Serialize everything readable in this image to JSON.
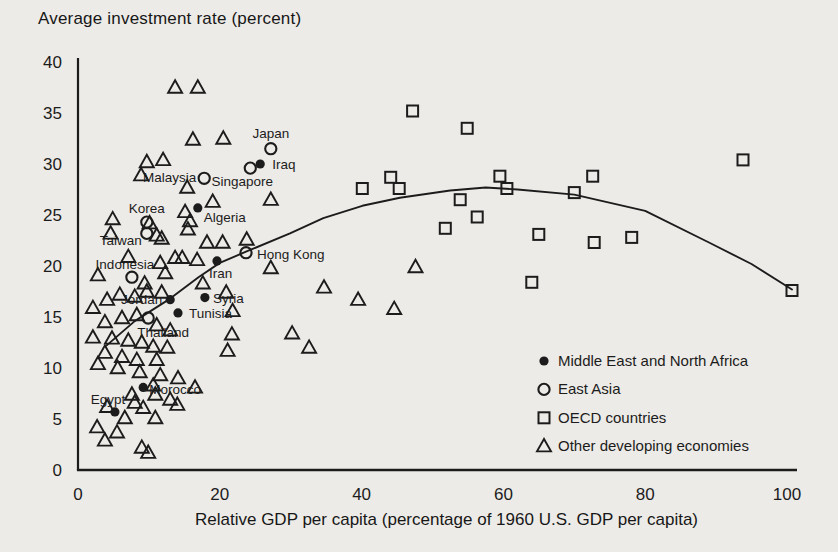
{
  "page": {
    "background": "#edebe7",
    "ink_color": "#1c1c1c"
  },
  "chart_data": {
    "type": "scatter",
    "title": "Average investment rate (percent)",
    "xlabel": "Relative GDP per capita (percentage of 1960 U.S. GDP per capita)",
    "ylabel": "Average investment rate (percent)",
    "xlim": [
      0,
      103
    ],
    "ylim": [
      0,
      40
    ],
    "x_ticks": [
      0,
      20,
      40,
      60,
      80,
      100
    ],
    "y_ticks": [
      0,
      5,
      10,
      15,
      20,
      25,
      30,
      35,
      40
    ],
    "grid": false,
    "legend_position": "inside-bottom-right",
    "series": [
      {
        "name": "Middle East and North Africa",
        "marker": "filled-circle",
        "points": [
          {
            "x": 25.7,
            "y": 30.0,
            "label": "Iraq",
            "dx": 12,
            "dy": 5,
            "anchor": "start"
          },
          {
            "x": 16.9,
            "y": 25.7,
            "label": "Algeria",
            "dx": 6,
            "dy": 14,
            "anchor": "start"
          },
          {
            "x": 19.6,
            "y": 20.5,
            "label": "Iran",
            "dx": -8,
            "dy": 17,
            "anchor": "start"
          },
          {
            "x": 17.9,
            "y": 16.9,
            "label": "Syria",
            "dx": 8,
            "dy": 5,
            "anchor": "start"
          },
          {
            "x": 13.0,
            "y": 16.7,
            "label": "Jordan",
            "dx": -8,
            "dy": 4,
            "anchor": "end"
          },
          {
            "x": 14.1,
            "y": 15.4,
            "label": "Tunisia",
            "dx": 11,
            "dy": 5,
            "anchor": "start"
          },
          {
            "x": 9.2,
            "y": 8.1,
            "label": "Morocco",
            "dx": 6,
            "dy": 7,
            "anchor": "start"
          },
          {
            "x": 5.2,
            "y": 5.7,
            "label": "Egypt",
            "dx": -7,
            "dy": -8,
            "anchor": "middle"
          }
        ]
      },
      {
        "name": "East Asia",
        "marker": "open-circle",
        "points": [
          {
            "x": 27.2,
            "y": 31.5,
            "label": "Japan",
            "dx": 0,
            "dy": -11,
            "anchor": "middle"
          },
          {
            "x": 24.3,
            "y": 29.6,
            "label": "Singapore",
            "dx": -8,
            "dy": 18,
            "anchor": "middle"
          },
          {
            "x": 17.8,
            "y": 28.6,
            "label": "Malaysia",
            "dx": -8,
            "dy": 4,
            "anchor": "end"
          },
          {
            "x": 9.7,
            "y": 24.3,
            "label": "Korea",
            "dx": 0,
            "dy": -9,
            "anchor": "middle"
          },
          {
            "x": 9.7,
            "y": 23.2,
            "label": "Taiwan",
            "dx": -5,
            "dy": 12,
            "anchor": "end"
          },
          {
            "x": 7.6,
            "y": 18.9,
            "label": "Indonesia",
            "dx": -7,
            "dy": -8,
            "anchor": "middle"
          },
          {
            "x": 23.7,
            "y": 21.3,
            "label": "Hong Kong",
            "dx": 11,
            "dy": 6,
            "anchor": "start"
          },
          {
            "x": 9.9,
            "y": 14.9,
            "label": "Thailand",
            "dx": -11,
            "dy": 19,
            "anchor": "start"
          }
        ]
      },
      {
        "name": "OECD countries",
        "marker": "open-square",
        "points": [
          [
            47.2,
            35.2
          ],
          [
            54.9,
            33.5
          ],
          [
            40.1,
            27.6
          ],
          [
            44.1,
            28.7
          ],
          [
            45.3,
            27.6
          ],
          [
            53.9,
            26.5
          ],
          [
            51.8,
            23.7
          ],
          [
            56.3,
            24.8
          ],
          [
            59.5,
            28.8
          ],
          [
            60.5,
            27.6
          ],
          [
            64.0,
            18.4
          ],
          [
            65.0,
            23.1
          ],
          [
            70.0,
            27.2
          ],
          [
            72.6,
            28.8
          ],
          [
            72.8,
            22.3
          ],
          [
            78.1,
            22.8
          ],
          [
            93.8,
            30.4
          ],
          [
            100.7,
            17.6
          ]
        ]
      },
      {
        "name": "Other developing economies",
        "marker": "open-triangle",
        "points": [
          [
            13.7,
            37.5
          ],
          [
            16.9,
            37.5
          ],
          [
            16.2,
            32.4
          ],
          [
            20.5,
            32.5
          ],
          [
            9.7,
            30.2
          ],
          [
            12.0,
            30.4
          ],
          [
            8.9,
            28.9
          ],
          [
            15.4,
            27.7
          ],
          [
            19.0,
            26.3
          ],
          [
            27.2,
            26.5
          ],
          [
            15.1,
            25.3
          ],
          [
            4.9,
            24.6
          ],
          [
            10.1,
            24.2
          ],
          [
            15.8,
            24.4
          ],
          [
            4.6,
            23.2
          ],
          [
            11.1,
            23.0
          ],
          [
            15.5,
            23.6
          ],
          [
            23.8,
            22.6
          ],
          [
            11.8,
            22.7
          ],
          [
            18.2,
            22.3
          ],
          [
            20.4,
            22.3
          ],
          [
            7.1,
            20.9
          ],
          [
            11.6,
            20.3
          ],
          [
            13.7,
            20.8
          ],
          [
            14.7,
            20.8
          ],
          [
            16.8,
            20.6
          ],
          [
            12.3,
            19.3
          ],
          [
            2.8,
            19.1
          ],
          [
            9.4,
            18.3
          ],
          [
            17.6,
            18.3
          ],
          [
            4.1,
            16.7
          ],
          [
            5.9,
            17.2
          ],
          [
            8.0,
            17.0
          ],
          [
            9.7,
            17.5
          ],
          [
            11.8,
            17.4
          ],
          [
            20.9,
            17.4
          ],
          [
            2.1,
            15.9
          ],
          [
            21.8,
            15.6
          ],
          [
            3.8,
            14.5
          ],
          [
            6.2,
            14.9
          ],
          [
            8.3,
            15.2
          ],
          [
            11.1,
            14.2
          ],
          [
            13.0,
            13.7
          ],
          [
            2.1,
            13.0
          ],
          [
            4.8,
            12.9
          ],
          [
            7.1,
            12.7
          ],
          [
            9.0,
            12.5
          ],
          [
            21.7,
            13.3
          ],
          [
            10.6,
            12.1
          ],
          [
            12.6,
            12.0
          ],
          [
            21.1,
            11.7
          ],
          [
            3.8,
            11.5
          ],
          [
            6.2,
            11.1
          ],
          [
            8.3,
            10.8
          ],
          [
            11.1,
            10.8
          ],
          [
            2.8,
            10.4
          ],
          [
            5.6,
            10.0
          ],
          [
            8.7,
            9.6
          ],
          [
            11.6,
            9.3
          ],
          [
            14.1,
            9.0
          ],
          [
            10.6,
            8.3
          ],
          [
            16.5,
            8.1
          ],
          [
            7.6,
            7.4
          ],
          [
            10.9,
            7.4
          ],
          [
            13.0,
            6.9
          ],
          [
            4.1,
            6.2
          ],
          [
            8.0,
            6.6
          ],
          [
            9.2,
            6.1
          ],
          [
            14.0,
            6.4
          ],
          [
            6.6,
            5.1
          ],
          [
            10.9,
            5.1
          ],
          [
            2.7,
            4.2
          ],
          [
            5.5,
            3.7
          ],
          [
            3.8,
            2.9
          ],
          [
            9.0,
            2.2
          ],
          [
            9.9,
            1.7
          ],
          [
            27.2,
            19.8
          ],
          [
            34.7,
            17.9
          ],
          [
            39.5,
            16.7
          ],
          [
            44.6,
            15.8
          ],
          [
            47.6,
            19.9
          ],
          [
            30.2,
            13.4
          ],
          [
            32.6,
            12.0
          ]
        ]
      }
    ],
    "fit_curve": {
      "points": [
        [
          4.0,
          12.2
        ],
        [
          8.0,
          14.6
        ],
        [
          13.0,
          16.8
        ],
        [
          17.0,
          18.9
        ],
        [
          20.0,
          20.3
        ],
        [
          23.7,
          21.4
        ],
        [
          29.9,
          23.2
        ],
        [
          34.6,
          24.7
        ],
        [
          40.1,
          25.9
        ],
        [
          45.4,
          26.7
        ],
        [
          52.5,
          27.4
        ],
        [
          57.5,
          27.7
        ],
        [
          62.0,
          27.5
        ],
        [
          70.0,
          27.0
        ],
        [
          80.0,
          25.4
        ],
        [
          89.0,
          22.3
        ],
        [
          95.0,
          20.2
        ],
        [
          100.7,
          17.7
        ]
      ]
    }
  }
}
